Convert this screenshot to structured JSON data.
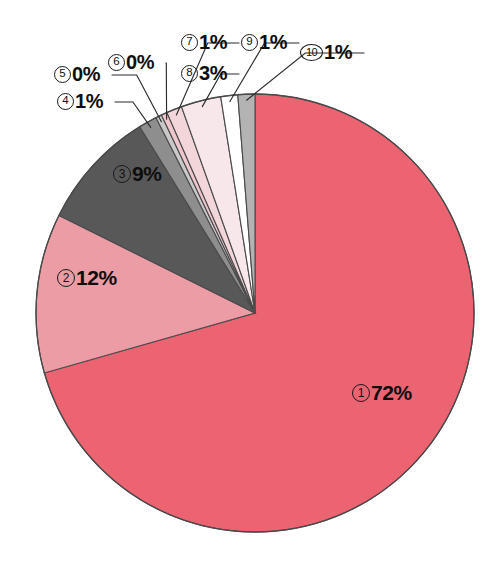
{
  "figure": {
    "kind": "pie-chart",
    "background_color": "#ffffff",
    "center": {
      "x": 255,
      "y": 313
    },
    "radius": 219,
    "outline_color": "#4a4a4a",
    "leader_line_color": "#2b2b2b"
  },
  "chart_data": {
    "type": "pie",
    "title": "",
    "subtitle": "",
    "xlabel": "",
    "ylabel": "",
    "grid": false,
    "legend_position": "none",
    "value_unit": "%",
    "start_angle_deg": 0,
    "direction": "clockwise",
    "total": 100,
    "categories": [
      "1",
      "2",
      "3",
      "4",
      "5",
      "6",
      "7",
      "8",
      "9",
      "10"
    ],
    "values": [
      72,
      12,
      9,
      1,
      0,
      0,
      1,
      3,
      1,
      1
    ],
    "labels": [
      "①72%",
      "②12%",
      "③9%",
      "④1%",
      "⑤0%",
      "⑥0%",
      "⑦1%",
      "⑧3%",
      "⑨1%",
      "⑩1%"
    ],
    "slices": [
      {
        "index": 1,
        "marker": "①",
        "percent_text": "72%",
        "value": 72,
        "color": "#ec6371",
        "sweep_deg": 259.2,
        "label_placement": "inside",
        "label_x": 352,
        "label_y": 382
      },
      {
        "index": 2,
        "marker": "②",
        "percent_text": "12%",
        "value": 12,
        "color": "#eb9ca5",
        "sweep_deg": 43.2,
        "label_placement": "inside",
        "label_x": 57,
        "label_y": 267
      },
      {
        "index": 3,
        "marker": "③",
        "percent_text": "9%",
        "value": 9,
        "color": "#585858",
        "sweep_deg": 32.4,
        "label_placement": "inside",
        "label_x": 113,
        "label_y": 163
      },
      {
        "index": 4,
        "marker": "④",
        "percent_text": "1%",
        "value": 1,
        "color": "#8e8e8e",
        "sweep_deg": 5.0,
        "label_placement": "outside",
        "label_x": 57,
        "label_y": 91
      },
      {
        "index": 5,
        "marker": "⑤",
        "percent_text": "0%",
        "value": 0,
        "color": "#c9c9c9",
        "sweep_deg": 1.6,
        "label_placement": "outside",
        "label_x": 54,
        "label_y": 64
      },
      {
        "index": 6,
        "marker": "⑥",
        "percent_text": "0%",
        "value": 0,
        "color": "#efc6cb",
        "sweep_deg": 1.6,
        "label_placement": "outside",
        "label_x": 108,
        "label_y": 52
      },
      {
        "index": 7,
        "marker": "⑦",
        "percent_text": "1%",
        "value": 1,
        "color": "#f2d6da",
        "sweep_deg": 4.2,
        "label_placement": "outside",
        "label_x": 181,
        "label_y": 32
      },
      {
        "index": 8,
        "marker": "⑧",
        "percent_text": "3%",
        "value": 3,
        "color": "#f8e7ea",
        "sweep_deg": 10.8,
        "label_placement": "outside",
        "label_x": 181,
        "label_y": 63
      },
      {
        "index": 9,
        "marker": "⑨",
        "percent_text": "1%",
        "value": 1,
        "color": "#ffffff",
        "sweep_deg": 4.6,
        "label_placement": "outside",
        "label_x": 241,
        "label_y": 32
      },
      {
        "index": 10,
        "marker": "⑩",
        "percent_text": "1%",
        "value": 1,
        "color": "#b3b3b3",
        "sweep_deg": 4.6,
        "label_placement": "outside",
        "label_x": 300,
        "label_y": 42
      }
    ]
  }
}
